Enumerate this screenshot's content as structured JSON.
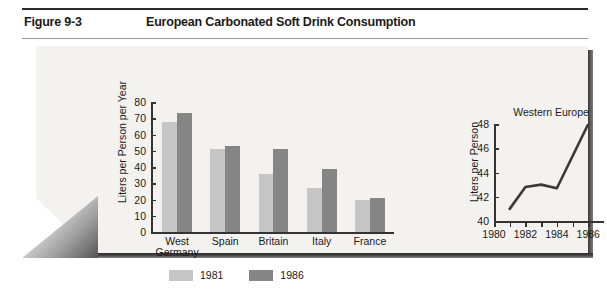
{
  "header": {
    "figure_label": "Figure 9-3",
    "title": "European Carbonated Soft Drink Consumption"
  },
  "legend": {
    "items": [
      {
        "label": "1981",
        "color": "#c6c6c6"
      },
      {
        "label": "1986",
        "color": "#858585"
      }
    ]
  },
  "chart_data": [
    {
      "type": "bar",
      "id": "country-consumption",
      "title": "",
      "xlabel": "",
      "ylabel": "Liters per Person per Year",
      "categories": [
        "West Germany",
        "Spain",
        "Britain",
        "Italy",
        "France"
      ],
      "series": [
        {
          "name": "1981",
          "color": "#c6c6c6",
          "values": [
            68,
            51,
            36,
            27,
            20
          ]
        },
        {
          "name": "1986",
          "color": "#858585",
          "values": [
            73,
            53,
            51,
            39,
            21
          ]
        }
      ],
      "ylim": [
        0,
        80
      ],
      "yticks": [
        0,
        10,
        20,
        30,
        40,
        50,
        60,
        70,
        80
      ],
      "grid": false,
      "legend_position": "bottom"
    },
    {
      "type": "line",
      "id": "western-europe-trend",
      "title": "Western Europe",
      "xlabel": "",
      "ylabel": "Liters per Person",
      "x": [
        1981,
        1982,
        1983,
        1984,
        1986
      ],
      "values": [
        41.0,
        42.8,
        43.0,
        42.7,
        48.0
      ],
      "xlim": [
        1980,
        1987
      ],
      "ylim": [
        40,
        48
      ],
      "yticks": [
        40,
        42,
        44,
        46,
        48
      ],
      "xticks": [
        1980,
        1981,
        1982,
        1983,
        1984,
        1985,
        1986
      ],
      "xticklabels": [
        "1980",
        "1982",
        "1984",
        "1986"
      ],
      "xticklabel_values": [
        1980,
        1982,
        1984,
        1986
      ],
      "line_color": "#3a3a3a",
      "grid": false
    }
  ]
}
